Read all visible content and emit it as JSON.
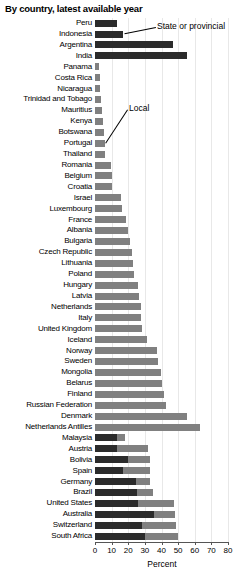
{
  "chart_data": {
    "type": "bar",
    "orientation": "horizontal",
    "stacked": true,
    "title": "By country, latest available year",
    "xlabel": "Percent",
    "ylabel": "",
    "xlim": [
      0,
      80
    ],
    "xticks": [
      0,
      10,
      20,
      30,
      40,
      50,
      60,
      70,
      80
    ],
    "xtick_labels": [
      "0",
      "10",
      "20",
      "30",
      "40",
      "50",
      "60",
      "70",
      "80"
    ],
    "grid": true,
    "grid_axis": "x",
    "legend_position": "inline-annotation",
    "series": [
      {
        "name": "State or provincial",
        "color": "#2b2b2b"
      },
      {
        "name": "Local",
        "color": "#808080"
      }
    ],
    "categories": [
      "Peru",
      "Indonesia",
      "Argentina",
      "India",
      "Panama",
      "Costa Rica",
      "Nicaragua",
      "Trinidad and Tobago",
      "Mauritius",
      "Kenya",
      "Botswana",
      "Portugal",
      "Thailand",
      "Romania",
      "Belgium",
      "Croatia",
      "Israel",
      "Luxembourg",
      "France",
      "Albania",
      "Bulgaria",
      "Czech Republic",
      "Lithuania",
      "Poland",
      "Hungary",
      "Latvia",
      "Netherlands",
      "Italy",
      "United Kingdom",
      "Iceland",
      "Norway",
      "Sweden",
      "Mongolia",
      "Belarus",
      "Finland",
      "Russian Federation",
      "Denmark",
      "Netherlands Antilles",
      "Malaysia",
      "Austria",
      "Bolivia",
      "Spain",
      "Germany",
      "Brazil",
      "United States",
      "Australia",
      "Switzerland",
      "South Africa"
    ],
    "values_state": [
      13.5,
      17.0,
      47.0,
      55.5,
      0,
      0,
      0,
      0,
      0,
      0,
      0,
      0,
      0,
      0,
      0,
      0,
      0,
      0,
      0,
      0,
      0,
      0,
      0,
      0,
      0,
      0,
      0,
      0,
      0,
      0,
      0,
      0,
      0,
      0,
      0,
      0,
      0,
      0,
      13.0,
      13.0,
      20.0,
      17.0,
      24.5,
      25.0,
      26.0,
      35.5,
      28.5,
      30.0
    ],
    "values_local": [
      0,
      0,
      0,
      0,
      2.6,
      2.8,
      3.0,
      3.4,
      4.0,
      4.6,
      5.2,
      6.0,
      6.2,
      9.5,
      10.0,
      10.4,
      15.5,
      16.5,
      18.5,
      20.0,
      21.0,
      22.0,
      23.0,
      23.5,
      26.0,
      26.5,
      27.5,
      27.5,
      28.0,
      31.0,
      37.0,
      38.0,
      39.5,
      40.5,
      41.5,
      43.0,
      55.5,
      63.0,
      5.0,
      19.0,
      13.0,
      16.0,
      8.5,
      10.0,
      21.5,
      12.5,
      20.0,
      20.0
    ],
    "annotations": [
      {
        "text": "State or provincial",
        "target_category": "Indonesia"
      },
      {
        "text": "Local",
        "target_category": "Portugal"
      }
    ]
  }
}
